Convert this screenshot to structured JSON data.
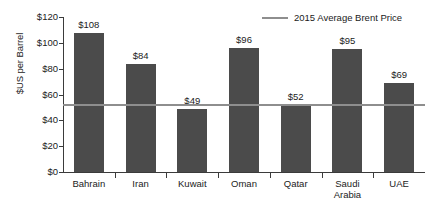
{
  "chart_data": {
    "type": "bar",
    "title": "",
    "xlabel": "",
    "ylabel": "$US per Barrel",
    "categories": [
      "Bahrain",
      "Iran",
      "Kuwait",
      "Oman",
      "Qatar",
      "Saudi Arabia",
      "UAE"
    ],
    "values": [
      108,
      84,
      49,
      96,
      52,
      95,
      69
    ],
    "value_labels": [
      "$108",
      "$84",
      "$49",
      "$96",
      "$52",
      "$95",
      "$69"
    ],
    "ylim": [
      0,
      120
    ],
    "ytick_values": [
      0,
      20,
      40,
      60,
      80,
      100,
      120
    ],
    "ytick_labels": [
      "$0",
      "$20",
      "$40",
      "$60",
      "$80",
      "$100",
      "$120"
    ],
    "grid": false,
    "legend_position": "top-right",
    "series": [
      {
        "name": "Fiscal Breakeven Oil Price",
        "type": "bar",
        "values": [
          108,
          84,
          49,
          96,
          52,
          95,
          69
        ],
        "color": "#4b4b4b"
      },
      {
        "name": "2015 Average Brent Price",
        "type": "hline",
        "value": 52,
        "color": "#8e8e8e"
      }
    ],
    "annotations": []
  },
  "legend": {
    "entries": [
      {
        "label": "2015 Average Brent Price",
        "color": "#8e8e8e",
        "marker": "line"
      }
    ]
  },
  "colors": {
    "bar": "#4b4b4b",
    "average_line": "#8e8e8e",
    "axis": "#3b3b3b",
    "text": "#1b1b1b",
    "background": "#ffffff"
  }
}
